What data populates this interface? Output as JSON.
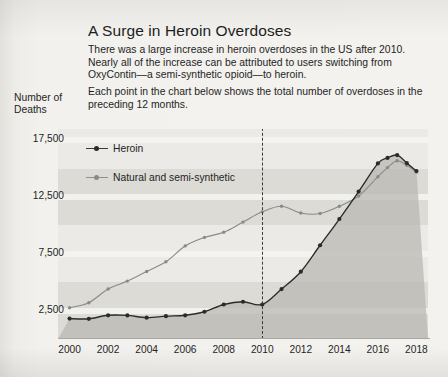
{
  "headline": "A Surge in Heroin Overdoses",
  "paragraphs": [
    "There was a large increase in heroin overdoses in the US after 2010. Nearly all of the increase can be attributed to users switching from OxyContin—a semi-synthetic opioid—to heroin.",
    "Each point in the chart below shows the total number of overdoses in the preceding 12 months."
  ],
  "axis_title": "Number of Deaths",
  "legend": [
    {
      "label": "Heroin",
      "color": "#2b2b2b"
    },
    {
      "label": "Natural and semi-synthetic",
      "color": "#8a8a87"
    }
  ],
  "colors": {
    "heroin": "#2b2b2b",
    "natural": "#8a8a87",
    "band_light": "#eceae6",
    "band_dark": "#dcdbd6",
    "page": "#f2f1ed",
    "annotation_line": "#3a3a3a"
  },
  "annotation": {
    "label": "2010",
    "x_value": 2010
  },
  "chart_data": {
    "type": "line",
    "title": "A Surge in Heroin Overdoses",
    "xlabel": "",
    "ylabel": "Number of Deaths",
    "xlim": [
      1999.4,
      2018.6
    ],
    "ylim": [
      0,
      18500
    ],
    "yticks": [
      2500,
      7500,
      12500,
      17500
    ],
    "ytick_labels": [
      "2,500",
      "7,500",
      "12,500",
      "17,500"
    ],
    "xticks": [
      2000,
      2002,
      2004,
      2006,
      2008,
      2010,
      2012,
      2014,
      2016,
      2018
    ],
    "xtick_labels": [
      "2000",
      "2002",
      "2004",
      "2006",
      "2008",
      "2010",
      "2012",
      "2014",
      "2016",
      "2018"
    ],
    "grid": "horizontal-bands",
    "legend_position": "top-left",
    "annotations": [
      {
        "type": "vline",
        "x": 2010,
        "style": "dashed",
        "color": "#3a3a3a"
      }
    ],
    "x": [
      2000,
      2001,
      2002,
      2003,
      2004,
      2005,
      2006,
      2007,
      2008,
      2009,
      2010,
      2011,
      2012,
      2013,
      2014,
      2015,
      2016,
      2016.5,
      2017,
      2017.5,
      2018
    ],
    "series": [
      {
        "name": "Heroin",
        "color": "#2b2b2b",
        "values": [
          1800,
          1780,
          2090,
          2080,
          1880,
          2010,
          2090,
          2400,
          3040,
          3280,
          3040,
          4400,
          5930,
          8260,
          10570,
          12990,
          15470,
          15950,
          16200,
          15500,
          14800
        ]
      },
      {
        "name": "Natural and semi-synthetic",
        "color": "#8a8a87",
        "values": [
          2750,
          3200,
          4400,
          5100,
          5950,
          6800,
          8200,
          8950,
          9400,
          10300,
          11200,
          11700,
          11100,
          11050,
          11700,
          12600,
          14300,
          15100,
          15700,
          15300,
          14700
        ]
      }
    ]
  }
}
